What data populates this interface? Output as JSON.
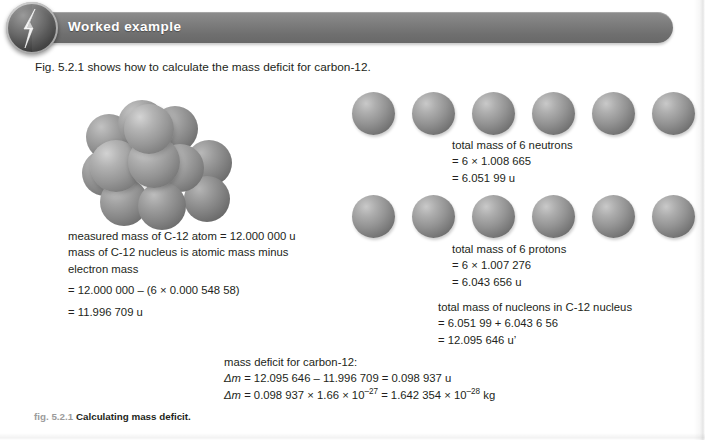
{
  "header": {
    "title": "Worked example",
    "badge_icon": "lightning-bolt-badge-icon"
  },
  "intro": {
    "text": "Fig. 5.2.1 shows how to calculate the mass deficit for carbon-12."
  },
  "diagram": {
    "nucleus_label": "carbon-12-nucleus-cluster",
    "nucleus_sphere_count": 12,
    "neutron_row_count": 6,
    "proton_row_count": 6,
    "sphere_color": "#939393"
  },
  "measured_block": {
    "line1": "measured mass of C-12 atom = 12.000 000 u",
    "line2": "mass of C-12 nucleus is atomic mass minus",
    "line3": "electron mass",
    "line4": "= 12.000 000 – (6 × 0.000 548 58)",
    "line5": "= 11.996 709 u"
  },
  "neutron_block": {
    "line1": "total mass of 6 neutrons",
    "line2": "= 6 × 1.008 665",
    "line3": "= 6.051 99 u"
  },
  "proton_block": {
    "line1": "total mass of 6 protons",
    "line2": "= 6 × 1.007 276",
    "line3": "= 6.043 656 u"
  },
  "nucleon_block": {
    "line1": "total mass of nucleons in C-12 nucleus",
    "line2": "= 6.051 99 + 6.043 6 56",
    "line3": "= 12.095 646 u’"
  },
  "deficit_block": {
    "line1": "mass deficit for carbon-12:",
    "line2_sym": "Δm",
    "line2_rest": " = 12.095 646 – 11.996 709 = 0.098 937 u",
    "line3_sym": "Δm",
    "line3_a": " = 0.098 937 × 1.66 × 10",
    "line3_exp1": "–27",
    "line3_b": " = 1.642 354 × 10",
    "line3_exp2": "–28",
    "line3_c": " kg"
  },
  "figure_caption": {
    "number": "fig. 5.2.1",
    "text": "Calculating mass deficit."
  }
}
